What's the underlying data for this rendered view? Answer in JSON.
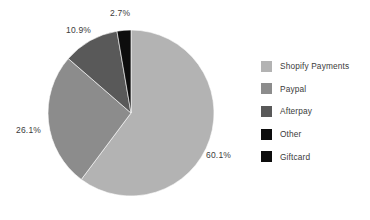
{
  "chart_data": {
    "type": "pie",
    "title": "",
    "subtitle": "",
    "xlabel": "",
    "ylabel": "",
    "grid": false,
    "legend_position": "right",
    "start_angle_deg": 0,
    "direction": "clockwise",
    "categories": [
      "Shopify Payments",
      "Paypal",
      "Afterpay",
      "Other",
      "Giftcard"
    ],
    "values": [
      60.1,
      26.1,
      10.9,
      2.7,
      0.0
    ],
    "value_unit": "%",
    "colors": [
      "#b3b3b3",
      "#8c8c8c",
      "#595959",
      "#0d0d0d",
      "#0d0d0d"
    ],
    "slices": [
      {
        "label": "Shopify Payments",
        "value": 60.1,
        "display": "60.1%",
        "color": "#b3b3b3",
        "visible_in_pie": true
      },
      {
        "label": "Paypal",
        "value": 26.1,
        "display": "26.1%",
        "color": "#8c8c8c",
        "visible_in_pie": true
      },
      {
        "label": "Afterpay",
        "value": 10.9,
        "display": "10.9%",
        "color": "#595959",
        "visible_in_pie": true
      },
      {
        "label": "Other",
        "value": 2.7,
        "display": "2.7%",
        "color": "#0d0d0d",
        "visible_in_pie": true
      },
      {
        "label": "Giftcard",
        "value": 0.0,
        "display": "",
        "color": "#0d0d0d",
        "visible_in_pie": false
      }
    ],
    "data_labels": [
      "60.1%",
      "26.1%",
      "10.9%",
      "2.7%"
    ]
  },
  "legend": {
    "items": [
      {
        "label": "Shopify Payments",
        "color": "#b3b3b3"
      },
      {
        "label": "Paypal",
        "color": "#8c8c8c"
      },
      {
        "label": "Afterpay",
        "color": "#595959"
      },
      {
        "label": "Other",
        "color": "#0d0d0d"
      },
      {
        "label": "Giftcard",
        "color": "#0d0d0d"
      }
    ]
  },
  "labels": {
    "other": "2.7%",
    "afterpay": "10.9%",
    "paypal": "26.1%",
    "shopify": "60.1%"
  },
  "style": {
    "background": "#ffffff",
    "text_color": "#3b3b3b"
  }
}
